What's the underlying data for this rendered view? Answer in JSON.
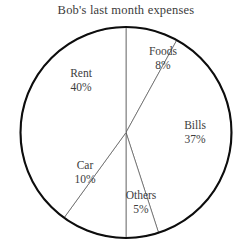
{
  "chart_data": {
    "type": "pie",
    "title": "Bob's last month expenses",
    "xlabel": "",
    "ylabel": "",
    "legend": "none",
    "grid": false,
    "start_angle_deg": 0,
    "direction": "clockwise",
    "categories": [
      "Foods",
      "Bills",
      "Others",
      "Car",
      "Rent"
    ],
    "values": [
      8,
      37,
      5,
      10,
      40
    ],
    "unit": "%",
    "slices": [
      {
        "label": "Foods",
        "value": 8,
        "percent_text": "8%",
        "start_deg": 0,
        "end_deg": 28.8,
        "color": "#ffffff"
      },
      {
        "label": "Bills",
        "value": 37,
        "percent_text": "37%",
        "start_deg": 28.8,
        "end_deg": 162.0,
        "color": "#ffffff"
      },
      {
        "label": "Others",
        "value": 5,
        "percent_text": "5%",
        "start_deg": 162.0,
        "end_deg": 180.0,
        "color": "#ffffff"
      },
      {
        "label": "Car",
        "value": 10,
        "percent_text": "10%",
        "start_deg": 180.0,
        "end_deg": 216.0,
        "color": "#ffffff"
      },
      {
        "label": "Rent",
        "value": 40,
        "percent_text": "40%",
        "start_deg": 216.0,
        "end_deg": 360.0,
        "color": "#ffffff"
      }
    ],
    "total": 100,
    "rim_color": "#0d0d0d",
    "divider_color": "#555555",
    "text_color": "#3d3d3d",
    "background": "#ffffff"
  },
  "labels": {
    "foods": {
      "name": "Foods",
      "pct": "8%"
    },
    "bills": {
      "name": "Bills",
      "pct": "37%"
    },
    "others": {
      "name": "Others",
      "pct": "5%"
    },
    "car": {
      "name": "Car",
      "pct": "10%"
    },
    "rent": {
      "name": "Rent",
      "pct": "40%"
    }
  }
}
